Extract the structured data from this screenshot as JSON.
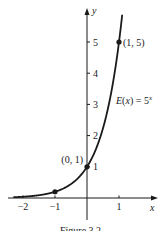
{
  "chart_data": {
    "type": "line",
    "title": "",
    "function_label": "E(x) = 5",
    "function_exponent": "x",
    "xlabel": "x",
    "ylabel": "y",
    "xlim": [
      -2.3,
      1.7
    ],
    "ylim": [
      -0.5,
      5.8
    ],
    "x_ticks": [
      -2,
      -1,
      1
    ],
    "x_tick_labels": [
      "−2",
      "−1",
      "1"
    ],
    "y_ticks": [
      1,
      2,
      3,
      4,
      5
    ],
    "y_tick_labels": [
      "1",
      "2",
      "3",
      "4",
      "5"
    ],
    "series": [
      {
        "name": "E(x) = 5^x",
        "function": "5^x",
        "x_range": [
          -2.3,
          1.1
        ]
      }
    ],
    "points": [
      {
        "x": -1,
        "y": 0.2,
        "label": ""
      },
      {
        "x": 0,
        "y": 1,
        "label": "(0, 1)"
      },
      {
        "x": 1,
        "y": 5,
        "label": "(1, 5)"
      }
    ],
    "grid": false,
    "legend": "none"
  },
  "caption": "Figure 3.2"
}
